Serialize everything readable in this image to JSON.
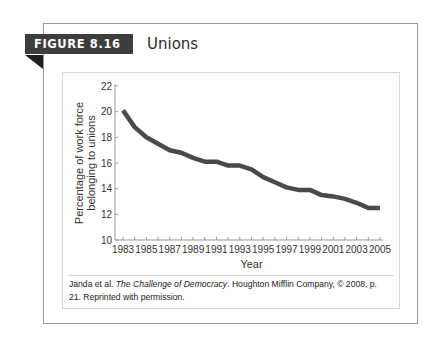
{
  "figure": {
    "label": "FIGURE 8.16",
    "title": "Unions",
    "caption": {
      "authors": "Janda et al. ",
      "book_title": "The Challenge of Democracy",
      "rest": ". Houghton Mifflin Company, © 2008, p. 21. Reprinted with permission."
    },
    "colors": {
      "label_bg": "#3d3d3d",
      "line": "#4a4a4a",
      "frame": "#9a9a9a"
    }
  },
  "chart_data": {
    "type": "line",
    "title": "Unions",
    "xlabel": "Year",
    "ylabel": "Percentage of work force belonging to unions",
    "ylabel_lines": [
      "Percentage of work force",
      "belonging to unions"
    ],
    "x": [
      1983,
      1984,
      1985,
      1986,
      1987,
      1988,
      1989,
      1990,
      1991,
      1992,
      1993,
      1994,
      1995,
      1996,
      1997,
      1998,
      1999,
      2000,
      2001,
      2002,
      2003,
      2004,
      2005
    ],
    "series": [
      {
        "name": "Union membership (%)",
        "values": [
          20.1,
          18.8,
          18.0,
          17.5,
          17.0,
          16.8,
          16.4,
          16.1,
          16.1,
          15.8,
          15.8,
          15.5,
          14.9,
          14.5,
          14.1,
          13.9,
          13.9,
          13.5,
          13.4,
          13.2,
          12.9,
          12.5,
          12.5
        ]
      }
    ],
    "xticks": [
      1983,
      1985,
      1987,
      1989,
      1991,
      1993,
      1995,
      1997,
      1999,
      2001,
      2003,
      2005
    ],
    "yticks": [
      10,
      12,
      14,
      16,
      18,
      20,
      22
    ],
    "xlim": [
      1983,
      2005
    ],
    "ylim": [
      10,
      22
    ],
    "grid": false,
    "legend": null
  }
}
